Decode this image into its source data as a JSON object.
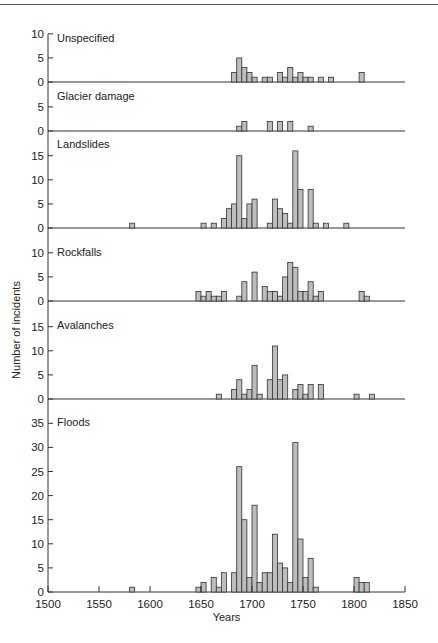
{
  "chart_data": {
    "type": "bar",
    "title": "",
    "xlabel": "Years",
    "ylabel": "Number of incidents",
    "xlim": [
      1500,
      1850
    ],
    "x_ticks": [
      1500,
      1550,
      1600,
      1650,
      1700,
      1750,
      1800,
      1850
    ],
    "bin_width_years": 5,
    "grid": false,
    "legend": "none",
    "panels": [
      {
        "name": "Unspecified",
        "y_ticks": [
          0,
          5,
          10
        ],
        "ylim": [
          0,
          10
        ],
        "bins": [
          [
            1680,
            2
          ],
          [
            1685,
            5
          ],
          [
            1690,
            3
          ],
          [
            1695,
            2
          ],
          [
            1700,
            1
          ],
          [
            1710,
            1
          ],
          [
            1715,
            1
          ],
          [
            1725,
            2
          ],
          [
            1730,
            1
          ],
          [
            1735,
            3
          ],
          [
            1740,
            1
          ],
          [
            1745,
            2
          ],
          [
            1750,
            1
          ],
          [
            1755,
            1
          ],
          [
            1765,
            1
          ],
          [
            1775,
            1
          ],
          [
            1805,
            2
          ]
        ]
      },
      {
        "name": "Glacier damage",
        "y_ticks": [
          0,
          5
        ],
        "ylim": [
          0,
          5
        ],
        "bins": [
          [
            1685,
            1
          ],
          [
            1690,
            2
          ],
          [
            1715,
            2
          ],
          [
            1725,
            2
          ],
          [
            1735,
            2
          ],
          [
            1755,
            1
          ]
        ]
      },
      {
        "name": "Landslides",
        "y_ticks": [
          0,
          5,
          10,
          15
        ],
        "ylim": [
          0,
          15
        ],
        "bins": [
          [
            1580,
            1
          ],
          [
            1650,
            1
          ],
          [
            1660,
            1
          ],
          [
            1670,
            2
          ],
          [
            1675,
            4
          ],
          [
            1680,
            5
          ],
          [
            1685,
            15
          ],
          [
            1690,
            2
          ],
          [
            1695,
            5
          ],
          [
            1700,
            6
          ],
          [
            1715,
            1
          ],
          [
            1720,
            6
          ],
          [
            1725,
            4
          ],
          [
            1730,
            3
          ],
          [
            1735,
            1
          ],
          [
            1740,
            16
          ],
          [
            1745,
            8
          ],
          [
            1755,
            8
          ],
          [
            1760,
            1
          ],
          [
            1770,
            1
          ],
          [
            1790,
            1
          ]
        ]
      },
      {
        "name": "Rockfalls",
        "y_ticks": [
          0,
          5,
          10
        ],
        "ylim": [
          0,
          10
        ],
        "bins": [
          [
            1645,
            2
          ],
          [
            1650,
            1
          ],
          [
            1655,
            2
          ],
          [
            1660,
            1
          ],
          [
            1665,
            1
          ],
          [
            1670,
            2
          ],
          [
            1685,
            1
          ],
          [
            1690,
            4
          ],
          [
            1700,
            6
          ],
          [
            1710,
            3
          ],
          [
            1715,
            2
          ],
          [
            1720,
            2
          ],
          [
            1725,
            1
          ],
          [
            1730,
            5
          ],
          [
            1735,
            8
          ],
          [
            1740,
            7
          ],
          [
            1745,
            2
          ],
          [
            1750,
            2
          ],
          [
            1755,
            4
          ],
          [
            1760,
            1
          ],
          [
            1765,
            2
          ],
          [
            1805,
            2
          ],
          [
            1810,
            1
          ]
        ]
      },
      {
        "name": "Avalanches",
        "y_ticks": [
          0,
          5,
          10,
          15
        ],
        "ylim": [
          0,
          15
        ],
        "bins": [
          [
            1665,
            1
          ],
          [
            1680,
            2
          ],
          [
            1685,
            4
          ],
          [
            1690,
            1
          ],
          [
            1695,
            2
          ],
          [
            1700,
            7
          ],
          [
            1705,
            1
          ],
          [
            1715,
            4
          ],
          [
            1720,
            11
          ],
          [
            1725,
            4
          ],
          [
            1730,
            5
          ],
          [
            1740,
            2
          ],
          [
            1745,
            3
          ],
          [
            1750,
            1
          ],
          [
            1755,
            3
          ],
          [
            1765,
            3
          ],
          [
            1800,
            1
          ],
          [
            1815,
            1
          ]
        ]
      },
      {
        "name": "Floods",
        "y_ticks": [
          0,
          5,
          10,
          15,
          20,
          25,
          30,
          35
        ],
        "ylim": [
          0,
          35
        ],
        "bins": [
          [
            1580,
            1
          ],
          [
            1645,
            1
          ],
          [
            1650,
            2
          ],
          [
            1660,
            3
          ],
          [
            1665,
            1
          ],
          [
            1670,
            4
          ],
          [
            1680,
            4
          ],
          [
            1685,
            26
          ],
          [
            1690,
            15
          ],
          [
            1695,
            3
          ],
          [
            1700,
            18
          ],
          [
            1705,
            2
          ],
          [
            1710,
            4
          ],
          [
            1715,
            4
          ],
          [
            1720,
            12
          ],
          [
            1725,
            6
          ],
          [
            1730,
            5
          ],
          [
            1735,
            2
          ],
          [
            1740,
            31
          ],
          [
            1745,
            11
          ],
          [
            1750,
            3
          ],
          [
            1755,
            7
          ],
          [
            1760,
            1
          ],
          [
            1800,
            3
          ],
          [
            1805,
            2
          ],
          [
            1810,
            2
          ]
        ]
      }
    ]
  },
  "colors": {
    "bar_fill": "#bdbdbd",
    "bar_stroke": "#333333",
    "axis": "#333333"
  }
}
